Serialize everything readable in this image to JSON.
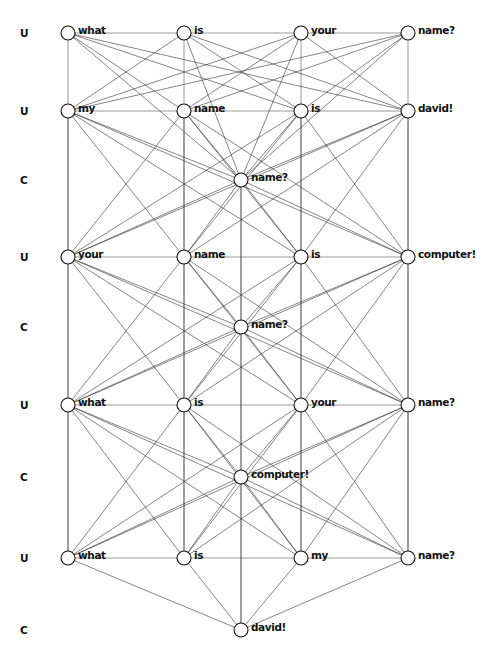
{
  "diagram": {
    "rows": [
      {
        "tag": "U",
        "type": "utterance",
        "words": [
          "what",
          "is",
          "your",
          "name?"
        ]
      },
      {
        "tag": "U",
        "type": "utterance",
        "words": [
          "my",
          "name",
          "is",
          "david!"
        ]
      },
      {
        "tag": "C",
        "type": "concept",
        "words": [
          "name?"
        ]
      },
      {
        "tag": "U",
        "type": "utterance",
        "words": [
          "your",
          "name",
          "is",
          "computer!"
        ]
      },
      {
        "tag": "C",
        "type": "concept",
        "words": [
          "name?"
        ]
      },
      {
        "tag": "U",
        "type": "utterance",
        "words": [
          "what",
          "is",
          "your",
          "name?"
        ]
      },
      {
        "tag": "C",
        "type": "concept",
        "words": [
          "computer!"
        ]
      },
      {
        "tag": "U",
        "type": "utterance",
        "words": [
          "what",
          "is",
          "my",
          "name?"
        ]
      },
      {
        "tag": "C",
        "type": "concept",
        "words": [
          "david!"
        ]
      }
    ],
    "colors": {
      "edge": "#333333",
      "node_fill": "#ffffff",
      "node_stroke": "#111111",
      "text": "#111111"
    }
  }
}
